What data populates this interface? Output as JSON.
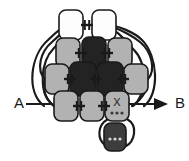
{
  "figure": {
    "kind": "network-diagram",
    "background_color": "#ffffff",
    "stroke_color": "#1a1a1a",
    "width": 189,
    "height": 161
  },
  "palette": {
    "white_node": "#fdfdfd",
    "light_gray_node": "#b2b2b2",
    "mid_gray_node": "#6e6e6e",
    "dark_node": "#232323",
    "bottom_node": "#3d3d3d",
    "outline": "#1a1a1a",
    "dot_light": "#d8d8d8",
    "dot_dark": "#3a3a3a"
  },
  "terminals": [
    {
      "id": "terminal-a",
      "label": "A",
      "side": "left",
      "has_arrow": false,
      "x": 14,
      "y": 104
    },
    {
      "id": "terminal-b",
      "label": "B",
      "side": "right",
      "has_arrow": true,
      "x": 175,
      "y": 104
    }
  ],
  "rows": [
    {
      "row_index": 0,
      "y": 25,
      "nodes": [
        {
          "id": "n-0-0",
          "fill": "white_node",
          "cx": 71,
          "cy": 25,
          "w": 24,
          "h": 30,
          "letter": "",
          "dots": false
        },
        {
          "id": "n-0-1",
          "fill": "white_node",
          "cx": 104,
          "cy": 25,
          "w": 24,
          "h": 30,
          "letter": "",
          "dots": false
        }
      ]
    },
    {
      "row_index": 1,
      "y": 53,
      "nodes": [
        {
          "id": "n-1-0",
          "fill": "light_gray_node",
          "cx": 68,
          "cy": 53,
          "w": 24,
          "h": 30,
          "letter": "",
          "dots": false
        },
        {
          "id": "n-1-1",
          "fill": "dark_node",
          "cx": 94,
          "cy": 53,
          "w": 24,
          "h": 32,
          "letter": "",
          "dots": false
        },
        {
          "id": "n-1-2",
          "fill": "light_gray_node",
          "cx": 120,
          "cy": 53,
          "w": 24,
          "h": 30,
          "letter": "",
          "dots": false
        }
      ]
    },
    {
      "row_index": 2,
      "y": 79,
      "nodes": [
        {
          "id": "n-2-0",
          "fill": "light_gray_node",
          "cx": 57,
          "cy": 79,
          "w": 24,
          "h": 30,
          "letter": "",
          "dots": false
        },
        {
          "id": "n-2-1",
          "fill": "dark_node",
          "cx": 83,
          "cy": 79,
          "w": 26,
          "h": 34,
          "letter": "",
          "dots": false
        },
        {
          "id": "n-2-2",
          "fill": "dark_node",
          "cx": 110,
          "cy": 79,
          "w": 26,
          "h": 34,
          "letter": "",
          "dots": false
        },
        {
          "id": "n-2-3",
          "fill": "light_gray_node",
          "cx": 136,
          "cy": 79,
          "w": 24,
          "h": 30,
          "letter": "",
          "dots": false
        }
      ]
    },
    {
      "row_index": 3,
      "y": 106,
      "nodes": [
        {
          "id": "n-3-0",
          "fill": "light_gray_node",
          "cx": 66,
          "cy": 106,
          "w": 24,
          "h": 30,
          "letter": "",
          "dots": false
        },
        {
          "id": "n-3-1",
          "fill": "light_gray_node",
          "cx": 92,
          "cy": 106,
          "w": 24,
          "h": 30,
          "letter": "",
          "dots": false
        },
        {
          "id": "n-3-2",
          "fill": "light_gray_node",
          "cx": 117,
          "cy": 106,
          "w": 24,
          "h": 30,
          "letter": "X",
          "dots": true
        }
      ]
    },
    {
      "row_index": 4,
      "y": 137,
      "nodes": [
        {
          "id": "n-4-0",
          "fill": "bottom_node",
          "cx": 115,
          "cy": 137,
          "w": 22,
          "h": 28,
          "letter": "",
          "dots": true
        }
      ]
    }
  ],
  "connectors": [
    {
      "id": "c-0-0",
      "x": 87,
      "y": 25
    },
    {
      "id": "c-1-0",
      "x": 81,
      "y": 53
    },
    {
      "id": "c-1-1",
      "x": 107,
      "y": 53
    },
    {
      "id": "c-2-0",
      "x": 70,
      "y": 79
    },
    {
      "id": "c-2-1",
      "x": 96,
      "y": 79
    },
    {
      "id": "c-2-2",
      "x": 123,
      "y": 79
    },
    {
      "id": "c-3-0",
      "x": 79,
      "y": 106
    },
    {
      "id": "c-3-1",
      "x": 104,
      "y": 106
    }
  ],
  "arcs": [
    {
      "id": "arc-left-outer",
      "d": "M 44 106 C 26 92 30 56 48 40 C 56 32 62 28 66 25"
    },
    {
      "id": "arc-left-mid",
      "d": "M 54 106 C 38 94 40 62 54 48 C 60 42 64 36 70 30"
    },
    {
      "id": "arc-left-inner",
      "d": "M 45 79 C 36 70 40 52 52 42 C 58 37 62 33 66 28"
    },
    {
      "id": "arc-left-low",
      "d": "M 54 106 C 44 98 42 88 45 80"
    },
    {
      "id": "arc-right-outer",
      "d": "M 144 106 C 160 94 158 56 142 40 C 134 32 118 26 109 25"
    },
    {
      "id": "arc-right-mid",
      "d": "M 133 106 C 146 96 148 64 134 50 C 128 44 120 32 110 28"
    },
    {
      "id": "arc-right-inner",
      "d": "M 148 79 C 156 70 152 52 140 42 C 134 37 122 30 112 27"
    },
    {
      "id": "arc-right-low",
      "d": "M 132 106 C 144 98 148 88 147 80"
    },
    {
      "id": "arc-bottom-left",
      "d": "M 108 119 C 96 126 98 140 105 145"
    },
    {
      "id": "arc-bottom-right",
      "d": "M 127 119 C 139 126 134 142 126 146"
    }
  ],
  "wires": [
    {
      "id": "wire-a",
      "d": "M 26 104 L 52 104"
    },
    {
      "id": "wire-b",
      "d": "M 129 104 L 166 104"
    }
  ]
}
